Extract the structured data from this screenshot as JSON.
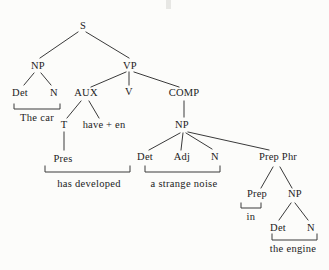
{
  "colors": {
    "background": "#fcfcfa",
    "line": "#3a3a3a",
    "text": "#1b1b1b"
  },
  "tree": {
    "nodes": [
      {
        "id": "s",
        "label": "S",
        "x": 83,
        "y": 26
      },
      {
        "id": "np1",
        "label": "NP",
        "x": 38,
        "y": 66
      },
      {
        "id": "vp",
        "label": "VP",
        "x": 130,
        "y": 66
      },
      {
        "id": "det1",
        "label": "Det",
        "x": 20,
        "y": 93
      },
      {
        "id": "n1",
        "label": "N",
        "x": 54,
        "y": 93
      },
      {
        "id": "aux",
        "label": "AUX",
        "x": 86,
        "y": 93
      },
      {
        "id": "v",
        "label": "V",
        "x": 129,
        "y": 92
      },
      {
        "id": "comp",
        "label": "COMP",
        "x": 184,
        "y": 93
      },
      {
        "id": "t",
        "label": "T",
        "x": 64,
        "y": 125
      },
      {
        "id": "have-en",
        "label": "have + en",
        "x": 104,
        "y": 125
      },
      {
        "id": "np2",
        "label": "NP",
        "x": 182,
        "y": 125
      },
      {
        "id": "pres",
        "label": "Pres",
        "x": 63,
        "y": 159
      },
      {
        "id": "det2",
        "label": "Det",
        "x": 145,
        "y": 157
      },
      {
        "id": "adj",
        "label": "Adj",
        "x": 182,
        "y": 157
      },
      {
        "id": "n2",
        "label": "N",
        "x": 215,
        "y": 157
      },
      {
        "id": "prep-phr",
        "label": "Prep Phr",
        "x": 278,
        "y": 157
      },
      {
        "id": "prep",
        "label": "Prep",
        "x": 257,
        "y": 194
      },
      {
        "id": "np3",
        "label": "NP",
        "x": 295,
        "y": 194
      },
      {
        "id": "det3",
        "label": "Det",
        "x": 278,
        "y": 228
      },
      {
        "id": "n3",
        "label": "N",
        "x": 311,
        "y": 228
      }
    ],
    "terminals": [
      {
        "id": "the-car",
        "label": "The car",
        "x": 37,
        "y": 118
      },
      {
        "id": "has-developed",
        "label": "has developed",
        "x": 89,
        "y": 184
      },
      {
        "id": "a-strange-noise",
        "label": "a strange noise",
        "x": 184,
        "y": 184
      },
      {
        "id": "in",
        "label": "in",
        "x": 251,
        "y": 217
      },
      {
        "id": "the-engine",
        "label": "the engine",
        "x": 293,
        "y": 249
      }
    ],
    "edges": [
      {
        "from": "s",
        "to": "np1",
        "x1": 78,
        "y1": 32,
        "x2": 40,
        "y2": 58
      },
      {
        "from": "s",
        "to": "vp",
        "x1": 86,
        "y1": 32,
        "x2": 129,
        "y2": 58
      },
      {
        "from": "np1",
        "to": "det1",
        "x1": 34,
        "y1": 73,
        "x2": 24,
        "y2": 85
      },
      {
        "from": "np1",
        "to": "n1",
        "x1": 41,
        "y1": 73,
        "x2": 51,
        "y2": 85
      },
      {
        "from": "vp",
        "to": "aux",
        "x1": 126,
        "y1": 72,
        "x2": 91,
        "y2": 87
      },
      {
        "from": "vp",
        "to": "v",
        "x1": 129,
        "y1": 72,
        "x2": 129,
        "y2": 85
      },
      {
        "from": "vp",
        "to": "comp",
        "x1": 134,
        "y1": 72,
        "x2": 179,
        "y2": 87
      },
      {
        "from": "aux",
        "to": "t",
        "x1": 81,
        "y1": 101,
        "x2": 67,
        "y2": 118
      },
      {
        "from": "aux",
        "to": "have-en",
        "x1": 89,
        "y1": 101,
        "x2": 99,
        "y2": 118
      },
      {
        "from": "t",
        "to": "pres",
        "x1": 64,
        "y1": 132,
        "x2": 64,
        "y2": 150
      },
      {
        "from": "comp",
        "to": "np2",
        "x1": 184,
        "y1": 101,
        "x2": 184,
        "y2": 117
      },
      {
        "from": "np2",
        "to": "det2",
        "x1": 180,
        "y1": 133,
        "x2": 149,
        "y2": 150
      },
      {
        "from": "np2",
        "to": "adj",
        "x1": 183,
        "y1": 133,
        "x2": 181,
        "y2": 150
      },
      {
        "from": "np2",
        "to": "n2",
        "x1": 186,
        "y1": 133,
        "x2": 212,
        "y2": 149
      },
      {
        "from": "np2",
        "to": "prep-phr",
        "x1": 188,
        "y1": 132,
        "x2": 269,
        "y2": 150
      },
      {
        "from": "prep-phr",
        "to": "prep",
        "x1": 273,
        "y1": 167,
        "x2": 261,
        "y2": 188
      },
      {
        "from": "prep-phr",
        "to": "np3",
        "x1": 280,
        "y1": 167,
        "x2": 292,
        "y2": 188
      },
      {
        "from": "np3",
        "to": "det3",
        "x1": 291,
        "y1": 203,
        "x2": 279,
        "y2": 220
      },
      {
        "from": "np3",
        "to": "n3",
        "x1": 295,
        "y1": 203,
        "x2": 308,
        "y2": 220
      }
    ],
    "brackets": [
      {
        "id": "the-car-bracket",
        "x1": 14,
        "x2": 60,
        "y": 109,
        "tick": 5
      },
      {
        "id": "has-developed-bracket",
        "x1": 45,
        "x2": 130,
        "y": 172,
        "tick": 6
      },
      {
        "id": "a-strange-noise-bracket",
        "x1": 145,
        "x2": 220,
        "y": 172,
        "tick": 6
      },
      {
        "id": "in-bracket",
        "x1": 241,
        "x2": 261,
        "y": 208,
        "tick": 5
      },
      {
        "id": "the-engine-bracket",
        "x1": 272,
        "x2": 317,
        "y": 240,
        "tick": 6
      }
    ]
  }
}
